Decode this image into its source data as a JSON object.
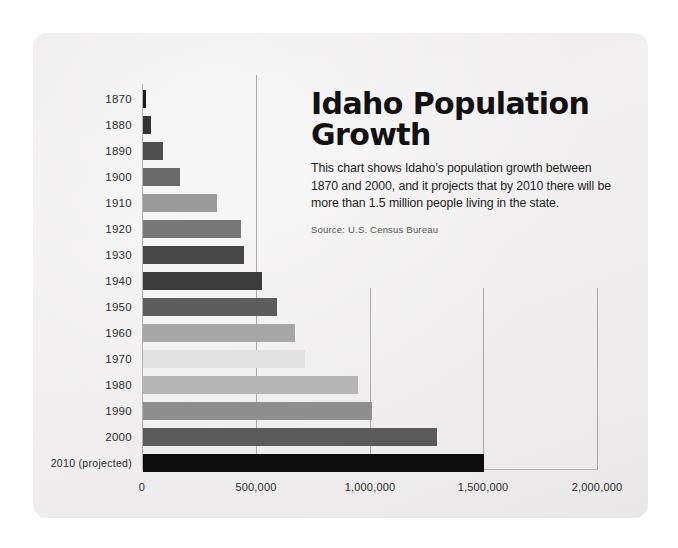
{
  "card": {
    "background_color": "#eeecec"
  },
  "header": {
    "title_line1": "Idaho Population",
    "title_line2": "Growth",
    "description": "This chart shows Idaho’s population growth between 1870 and 2000, and it projects that by 2010 there will be more than 1.5 million people living in the state.",
    "source": "Source: U.S. Census Bureau"
  },
  "chart_data": {
    "type": "bar",
    "orientation": "horizontal",
    "title": "Idaho Population Growth",
    "subtitle": "This chart shows Idaho’s population growth between 1870 and 2000, and it projects that by 2010 there will be more than 1.5 million people living in the state.",
    "source": "Source: U.S. Census Bureau",
    "xlabel": "",
    "ylabel": "",
    "xlim": [
      0,
      2000000
    ],
    "xticks": [
      0,
      500000,
      1000000,
      1500000,
      2000000
    ],
    "xtick_labels": [
      "0",
      "500,000",
      "1,000,000",
      "1,500,000",
      "2,000,000"
    ],
    "grid": true,
    "legend": "none",
    "categories": [
      "1870",
      "1880",
      "1890",
      "1900",
      "1910",
      "1920",
      "1930",
      "1940",
      "1950",
      "1960",
      "1970",
      "1980",
      "1990",
      "2000",
      "2010 (projected)"
    ],
    "values": [
      15000,
      33000,
      89000,
      162000,
      326000,
      432000,
      445000,
      525000,
      589000,
      667000,
      713000,
      944000,
      1007000,
      1294000,
      1500000
    ],
    "bar_colors": [
      "#1a1a1a",
      "#333333",
      "#4f4f4f",
      "#6a6a6a",
      "#9a9a9a",
      "#777777",
      "#464646",
      "#3c3c3c",
      "#5c5c5c",
      "#a6a6a6",
      "#e2e2e2",
      "#b5b5b5",
      "#8e8e8e",
      "#5a5a5a",
      "#0d0d0d"
    ],
    "gridline_color": "#a9a7a7",
    "axis_color": "#b3b1b1"
  }
}
